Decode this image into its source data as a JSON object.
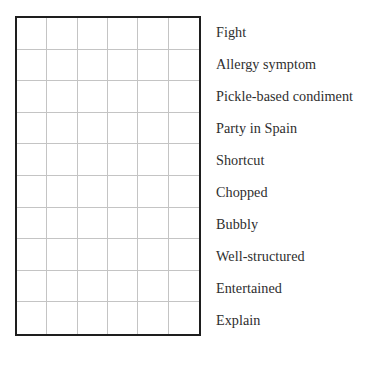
{
  "puzzle": {
    "grid": {
      "rows": 10,
      "cols": 6,
      "cells": [
        [
          "",
          "",
          "",
          "",
          "",
          ""
        ],
        [
          "",
          "",
          "",
          "",
          "",
          ""
        ],
        [
          "",
          "",
          "",
          "",
          "",
          ""
        ],
        [
          "",
          "",
          "",
          "",
          "",
          ""
        ],
        [
          "",
          "",
          "",
          "",
          "",
          ""
        ],
        [
          "",
          "",
          "",
          "",
          "",
          ""
        ],
        [
          "",
          "",
          "",
          "",
          "",
          ""
        ],
        [
          "",
          "",
          "",
          "",
          "",
          ""
        ],
        [
          "",
          "",
          "",
          "",
          "",
          ""
        ],
        [
          "",
          "",
          "",
          "",
          "",
          ""
        ]
      ]
    },
    "clues": [
      {
        "label": "Fight"
      },
      {
        "label": "Allergy symptom"
      },
      {
        "label": "Pickle-based condiment"
      },
      {
        "label": "Party in Spain"
      },
      {
        "label": "Shortcut"
      },
      {
        "label": "Chopped"
      },
      {
        "label": "Bubbly"
      },
      {
        "label": "Well-structured"
      },
      {
        "label": "Entertained"
      },
      {
        "label": "Explain"
      }
    ],
    "colors": {
      "border": "#1e1e1e",
      "grid_line": "#c4c4c4",
      "text": "#2e2e2e",
      "background": "#ffffff"
    }
  }
}
